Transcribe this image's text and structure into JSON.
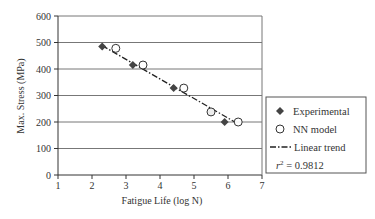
{
  "chart_data": {
    "type": "scatter",
    "title": "",
    "xlabel": "Fatigue Life (log N)",
    "ylabel": "Max. Stress (MPa)",
    "xlim": [
      1,
      7
    ],
    "ylim": [
      0,
      600
    ],
    "x_ticks": [
      1,
      2,
      3,
      4,
      5,
      6,
      7
    ],
    "y_ticks": [
      0,
      100,
      200,
      300,
      400,
      500,
      600
    ],
    "grid": "horizontal",
    "legend_position": "right",
    "series": [
      {
        "name": "Experimental",
        "marker": "filled-diamond",
        "x": [
          2.3,
          3.2,
          4.4,
          5.5,
          5.9
        ],
        "y": [
          485,
          415,
          328,
          238,
          200
        ]
      },
      {
        "name": "NN model",
        "marker": "open-circle",
        "x": [
          2.7,
          3.5,
          4.7,
          5.5,
          6.3
        ],
        "y": [
          478,
          415,
          328,
          238,
          200
        ]
      },
      {
        "name": "Linear trend",
        "style": "dash-dot",
        "x": [
          2.3,
          6.2
        ],
        "y": [
          488,
          200
        ]
      }
    ],
    "annotations": [
      {
        "text": "r² = 0.9812",
        "location": "legend"
      }
    ]
  },
  "legend": {
    "items": [
      {
        "label": "Experimental",
        "icon": "filled-diamond-icon"
      },
      {
        "label": "NN model",
        "icon": "open-circle-icon"
      },
      {
        "label": "Linear trend",
        "icon": "dash-dot-line-icon"
      }
    ],
    "r2_symbol": "r",
    "r2_exp": "2",
    "r2_value": " = 0.9812"
  },
  "colors": {
    "marker": "#444444",
    "grid": "#777777",
    "axis": "#333333"
  }
}
